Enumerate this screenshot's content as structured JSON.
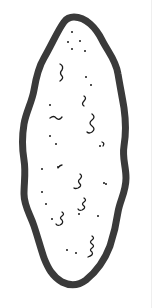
{
  "illustration": {
    "subject": "elongated-blob-shape",
    "colors": {
      "outline": "#3a3a3a",
      "fill": "#ffffff",
      "specks": "#1a1a1a",
      "background": "#ffffff"
    }
  }
}
